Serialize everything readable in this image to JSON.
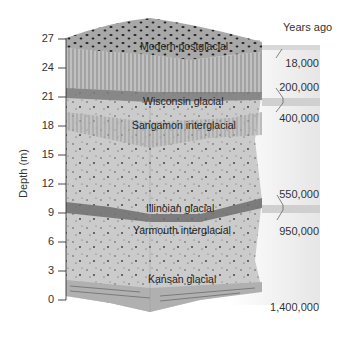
{
  "diagram": {
    "y_axis": {
      "label": "Depth (m)",
      "ticks": [
        "27",
        "24",
        "21",
        "18",
        "15",
        "12",
        "9",
        "6",
        "3",
        "0"
      ]
    },
    "age_column": {
      "header": "Years ago",
      "ages": [
        "18,000",
        "200,000",
        "400,000",
        "550,000",
        "950,000",
        "1,400,000"
      ]
    },
    "layers": [
      {
        "name": "Modern postglacial"
      },
      {
        "name": "Wisconsin glacial"
      },
      {
        "name": "Sangamon interglacial"
      },
      {
        "name": "Illinoian glacial"
      },
      {
        "name": "Yarmouth interglacial"
      },
      {
        "name": "Kansan glacial"
      }
    ],
    "colors": {
      "block_fill": "#c8c8c8",
      "top_fill": "#a9a9a9",
      "band_dark": "#7a7a7a",
      "age_band": "#dcdcdc",
      "age_band_dark": "#c4c4c4"
    }
  }
}
